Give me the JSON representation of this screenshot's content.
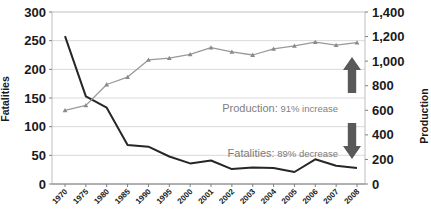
{
  "chart_data": {
    "type": "line",
    "title": "",
    "x_categories": [
      "1970",
      "1975",
      "1980",
      "1985",
      "1990",
      "1995",
      "2000",
      "2001",
      "2002",
      "2003",
      "2004",
      "2005",
      "2006",
      "2007",
      "2008"
    ],
    "series": [
      {
        "name": "Fatalities",
        "axis": "left",
        "color": "#262626",
        "line_width": 2,
        "marker": "none",
        "values": [
          258,
          153,
          133,
          68,
          65,
          48,
          36,
          41,
          26,
          29,
          28,
          21,
          43,
          32,
          28
        ]
      },
      {
        "name": "Production",
        "axis": "right",
        "color": "#999999",
        "line_width": 1.3,
        "marker": "triangle",
        "marker_color": "#8a8a8a",
        "values": [
          600,
          640,
          810,
          870,
          1010,
          1025,
          1055,
          1110,
          1075,
          1050,
          1100,
          1125,
          1155,
          1130,
          1150
        ]
      }
    ],
    "left_axis": {
      "label": "Fatalities",
      "min": 0,
      "max": 300,
      "step": 50,
      "tick_labels": [
        "300",
        "250",
        "200",
        "150",
        "100",
        "50",
        "0"
      ]
    },
    "right_axis": {
      "label": "Production",
      "min": 0,
      "max": 1400,
      "step": 200,
      "tick_labels": [
        "1,400",
        "1,200",
        "1,000",
        "800",
        "600",
        "400",
        "200",
        "0"
      ]
    },
    "grid": true,
    "gridline_color": "#d9d9d9",
    "border_color": "#bfbfbf",
    "axis_line_color": "#808080",
    "tick_label_color": "#1a1a1a",
    "annotations": [
      {
        "lead": "Production:",
        "rest": " 91% increase",
        "color": "#808080"
      },
      {
        "lead": "Fatalities:",
        "rest": " 89% decrease",
        "color": "#7a7a7a"
      }
    ],
    "arrow_color": "#595959",
    "arrows": [
      {
        "direction": "up"
      },
      {
        "direction": "down"
      }
    ]
  }
}
